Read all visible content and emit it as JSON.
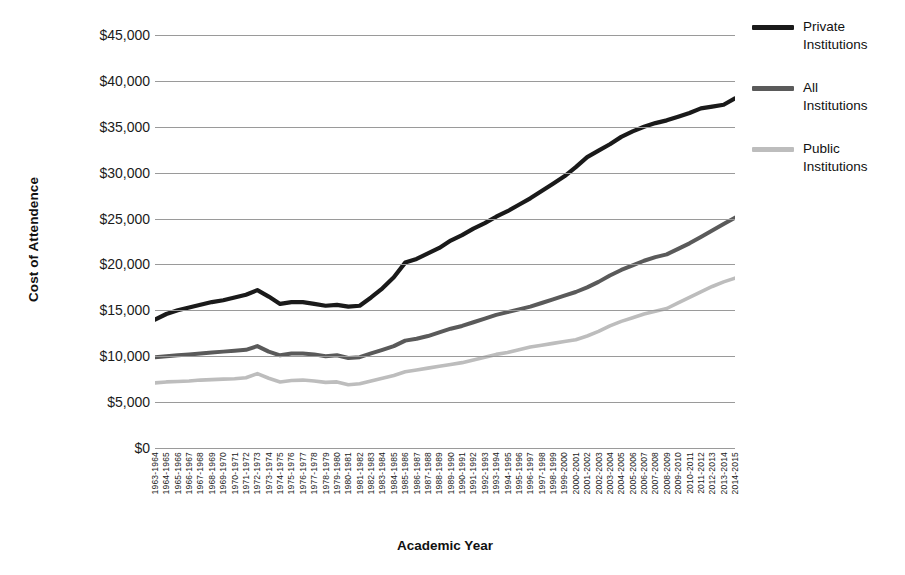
{
  "chart_data": {
    "type": "line",
    "title": "",
    "xlabel": "Academic Year",
    "ylabel": "Cost of Attendence",
    "ylim": [
      0,
      47000
    ],
    "yticks": [
      "$0",
      "$5,000",
      "$10,000",
      "$15,000",
      "$20,000",
      "$25,000",
      "$30,000",
      "$35,000",
      "$40,000",
      "$45,000"
    ],
    "ytick_values": [
      0,
      5000,
      10000,
      15000,
      20000,
      25000,
      30000,
      35000,
      40000,
      45000
    ],
    "grid": true,
    "legend_position": "right",
    "categories": [
      "1963-1964",
      "1964-1965",
      "1965-1966",
      "1966-1967",
      "1967-1968",
      "1968-1969",
      "1969-1970",
      "1970-1971",
      "1971-1972",
      "1972-1973",
      "1973-1974",
      "1974-1975",
      "1975-1976",
      "1976-1977",
      "1977-1978",
      "1978-1979",
      "1979-1980",
      "1980-1981",
      "1981-1982",
      "1982-1983",
      "1983-1984",
      "1984-1985",
      "1985-1986",
      "1986-1987",
      "1987-1988",
      "1988-1989",
      "1989-1990",
      "1990-1991",
      "1991-1992",
      "1992-1993",
      "1993-1994",
      "1994-1995",
      "1995-1996",
      "1996-1997",
      "1997-1998",
      "1998-1999",
      "1999-2000",
      "2000-2001",
      "2001-2002",
      "2002-2003",
      "2003-2004",
      "2004-2005",
      "2005-2006",
      "2006-2007",
      "2007-2008",
      "2008-2009",
      "2009-2010",
      "2010-2011",
      "2011-2012",
      "2012-2013",
      "2013-2014",
      "2014-2015"
    ],
    "series": [
      {
        "name": "Private Institutions",
        "color": "#1a1a1a",
        "values": [
          14000,
          14600,
          15000,
          15300,
          15600,
          15900,
          16100,
          16400,
          16700,
          17200,
          16500,
          15700,
          15900,
          15900,
          15700,
          15500,
          15600,
          15400,
          15500,
          16400,
          17400,
          18600,
          20200,
          20600,
          21200,
          21800,
          22600,
          23200,
          23900,
          24500,
          25200,
          25800,
          26500,
          27200,
          28000,
          28800,
          29600,
          30600,
          31700,
          32400,
          33100,
          33900,
          34500,
          35000,
          35400,
          35700,
          36100,
          36500,
          37000,
          37200,
          37400,
          38100
        ]
      },
      {
        "name": "All Institutions",
        "color": "#5a5a5a",
        "values": [
          9900,
          10000,
          10100,
          10200,
          10300,
          10400,
          10500,
          10600,
          10700,
          11100,
          10500,
          10100,
          10300,
          10300,
          10200,
          10000,
          10100,
          9800,
          9900,
          10300,
          10700,
          11100,
          11700,
          11900,
          12200,
          12600,
          13000,
          13300,
          13700,
          14100,
          14500,
          14800,
          15100,
          15400,
          15800,
          16200,
          16600,
          17000,
          17500,
          18100,
          18800,
          19400,
          19900,
          20400,
          20800,
          21100,
          21700,
          22300,
          23000,
          23700,
          24400,
          25100
        ]
      },
      {
        "name": "Public Institutions",
        "color": "#bdbdbd",
        "values": [
          7100,
          7200,
          7250,
          7300,
          7400,
          7450,
          7500,
          7550,
          7650,
          8100,
          7600,
          7200,
          7350,
          7400,
          7300,
          7150,
          7200,
          6900,
          7000,
          7300,
          7600,
          7900,
          8300,
          8500,
          8700,
          8900,
          9100,
          9300,
          9600,
          9900,
          10200,
          10400,
          10700,
          11000,
          11200,
          11400,
          11600,
          11800,
          12200,
          12700,
          13300,
          13800,
          14200,
          14600,
          14900,
          15200,
          15800,
          16400,
          17000,
          17600,
          18100,
          18500
        ]
      }
    ]
  },
  "legend": {
    "items": [
      {
        "label_line1": "Private",
        "label_line2": "Institutions"
      },
      {
        "label_line1": "All",
        "label_line2": "Institutions"
      },
      {
        "label_line1": "Public",
        "label_line2": "Institutions"
      }
    ]
  }
}
